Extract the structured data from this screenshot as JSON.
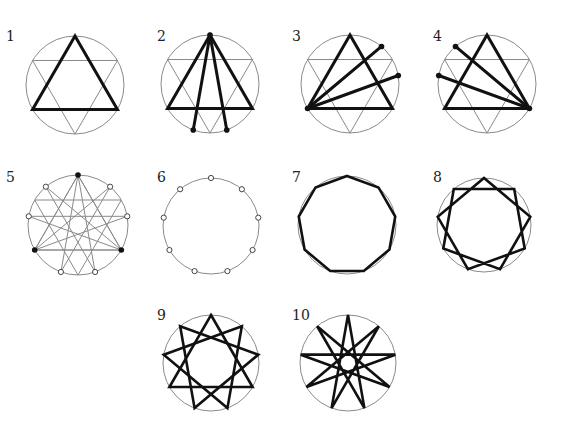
{
  "diagram": {
    "title": "",
    "colors": {
      "thin": "#8a8a8a",
      "thick": "#111111",
      "background": "#ffffff"
    },
    "figures": [
      {
        "id": 1,
        "label": "1",
        "cx": 75,
        "cy": 85,
        "r": 49,
        "label_x": 6,
        "label_y": 41,
        "hexagram": true,
        "thick_polygons": [
          [
            0,
            3,
            6
          ]
        ],
        "thick_segments": [],
        "dots": [],
        "open_dots": [],
        "thin_segments": [],
        "n": 9
      },
      {
        "id": 2,
        "label": "2",
        "cx": 210,
        "cy": 84,
        "r": 49,
        "label_x": 157,
        "label_y": 41,
        "hexagram": true,
        "thick_polygons": [
          [
            0,
            3,
            6
          ]
        ],
        "thick_segments": [
          [
            0,
            4
          ],
          [
            0,
            5
          ]
        ],
        "dots": [
          0,
          4,
          5
        ],
        "open_dots": [],
        "thin_segments": [],
        "n": 9
      },
      {
        "id": 3,
        "label": "3",
        "cx": 350,
        "cy": 84,
        "r": 49,
        "label_x": 292,
        "label_y": 41,
        "hexagram": true,
        "thick_polygons": [
          [
            0,
            3,
            6
          ]
        ],
        "thick_segments": [
          [
            6,
            1
          ],
          [
            6,
            2
          ]
        ],
        "dots": [
          6,
          1,
          2
        ],
        "open_dots": [],
        "thin_segments": [],
        "n": 9
      },
      {
        "id": 4,
        "label": "4",
        "cx": 487,
        "cy": 84,
        "r": 49,
        "label_x": 433,
        "label_y": 41,
        "hexagram": true,
        "thick_polygons": [
          [
            0,
            3,
            6
          ]
        ],
        "thick_segments": [
          [
            3,
            7
          ],
          [
            3,
            8
          ]
        ],
        "dots": [
          3,
          7,
          8
        ],
        "open_dots": [],
        "thin_segments": [],
        "n": 9
      },
      {
        "id": 5,
        "label": "5",
        "cx": 78,
        "cy": 225,
        "r": 50,
        "label_x": 6,
        "label_y": 182,
        "hexagram": true,
        "thick_polygons": [],
        "thick_segments": [],
        "dots": [
          0,
          3,
          6
        ],
        "open_dots": [
          1,
          2,
          4,
          5,
          7,
          8
        ],
        "thin_segments": [
          [
            0,
            4
          ],
          [
            4,
            8
          ],
          [
            8,
            3
          ],
          [
            3,
            7
          ],
          [
            7,
            2
          ],
          [
            2,
            6
          ],
          [
            6,
            1
          ],
          [
            1,
            5
          ],
          [
            5,
            0
          ],
          [
            0,
            3
          ],
          [
            3,
            6
          ],
          [
            6,
            0
          ]
        ],
        "n": 9
      },
      {
        "id": 6,
        "label": "6",
        "cx": 211,
        "cy": 226,
        "r": 48,
        "label_x": 157,
        "label_y": 182,
        "hexagram": false,
        "thick_polygons": [],
        "thick_segments": [],
        "dots": [],
        "open_dots": [
          0,
          1,
          2,
          3,
          4,
          5,
          6,
          7,
          8
        ],
        "thin_segments": [],
        "n": 9
      },
      {
        "id": 7,
        "label": "7",
        "cx": 347,
        "cy": 225,
        "r": 49,
        "label_x": 292,
        "label_y": 182,
        "hexagram": false,
        "star_step": 1,
        "thick_polygons": [],
        "thick_segments": [],
        "dots": [],
        "open_dots": [],
        "thin_segments": [],
        "n": 9
      },
      {
        "id": 8,
        "label": "8",
        "cx": 484,
        "cy": 225,
        "r": 47,
        "label_x": 433,
        "label_y": 182,
        "hexagram": false,
        "star_step": 2,
        "thick_polygons": [],
        "thick_segments": [],
        "dots": [],
        "open_dots": [],
        "thin_segments": [],
        "n": 9
      },
      {
        "id": 9,
        "label": "9",
        "cx": 211,
        "cy": 363,
        "r": 48,
        "label_x": 157,
        "label_y": 320,
        "hexagram": false,
        "star_step": 3,
        "thick_polygons": [],
        "thick_segments": [],
        "dots": [],
        "open_dots": [],
        "thin_segments": [],
        "n": 9
      },
      {
        "id": 10,
        "label": "10",
        "cx": 348,
        "cy": 363,
        "r": 48,
        "label_x": 292,
        "label_y": 320,
        "hexagram": false,
        "star_step": 4,
        "thick_polygons": [],
        "thick_segments": [],
        "dots": [],
        "open_dots": [],
        "thin_segments": [],
        "n": 9
      }
    ]
  }
}
